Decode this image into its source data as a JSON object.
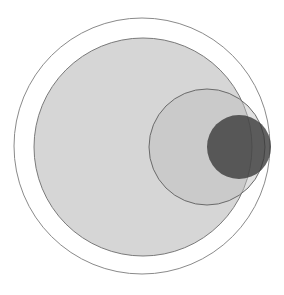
{
  "diagram": {
    "type": "nested-circles",
    "width": 284,
    "height": 295,
    "circles": [
      {
        "name": "outer-circle",
        "cx": 142,
        "cy": 146,
        "r": 128,
        "fill": "none",
        "stroke": "#8a8a8a",
        "fill_opacity": 0
      },
      {
        "name": "large-gray-circle",
        "cx": 143,
        "cy": 147,
        "r": 109,
        "fill": "#c8c8c8",
        "stroke": "#7a7a7a",
        "fill_opacity": 0.75
      },
      {
        "name": "medium-circle",
        "cx": 207,
        "cy": 147,
        "r": 58,
        "fill": "#bdbdbd",
        "stroke": "#6a6a6a",
        "fill_opacity": 0.45
      },
      {
        "name": "small-dark-circle",
        "cx": 239,
        "cy": 147,
        "r": 32,
        "fill": "#3a3a3a",
        "stroke": "none",
        "fill_opacity": 0.8
      }
    ]
  }
}
